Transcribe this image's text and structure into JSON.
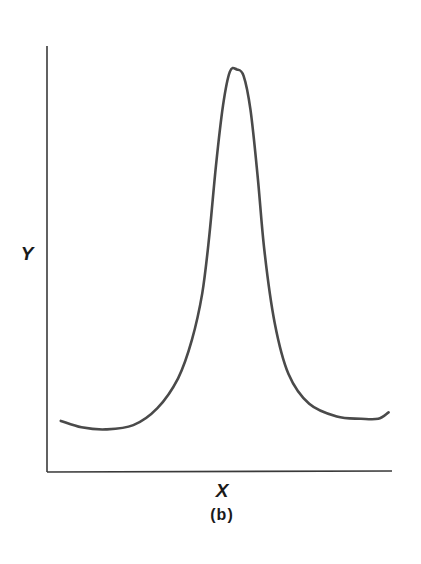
{
  "chart_data": {
    "type": "line",
    "title": "",
    "xlabel": "X",
    "ylabel": "Y",
    "caption": "(b)",
    "grid": false,
    "legend": null,
    "ticks": false,
    "xlim": [
      0,
      1
    ],
    "ylim": [
      0,
      1
    ],
    "series": [
      {
        "name": "curve",
        "color": "#4a4a4a",
        "x": [
          0.04,
          0.1,
          0.17,
          0.25,
          0.32,
          0.38,
          0.42,
          0.45,
          0.47,
          0.49,
          0.51,
          0.53,
          0.55,
          0.57,
          0.59,
          0.61,
          0.63,
          0.66,
          0.7,
          0.76,
          0.84,
          0.91,
          0.96,
          0.99
        ],
        "y": [
          0.12,
          0.105,
          0.1,
          0.11,
          0.15,
          0.22,
          0.31,
          0.42,
          0.55,
          0.72,
          0.86,
          0.94,
          0.945,
          0.93,
          0.85,
          0.7,
          0.52,
          0.35,
          0.23,
          0.16,
          0.13,
          0.125,
          0.125,
          0.14
        ]
      }
    ]
  },
  "labels": {
    "y_axis": "Y",
    "x_axis": "X",
    "caption": "(b)"
  },
  "colors": {
    "axis": "#3a3a3a",
    "curve": "#4a4a4a",
    "text": "#1a1a1a"
  }
}
